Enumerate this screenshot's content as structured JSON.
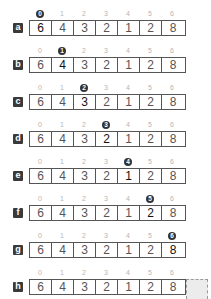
{
  "rows": [
    {
      "label": "a",
      "active": 0,
      "indices": [
        "0",
        "1",
        "2",
        "3",
        "4",
        "5",
        "6"
      ],
      "values": [
        "6",
        "4",
        "3",
        "2",
        "1",
        "2",
        "8"
      ]
    },
    {
      "label": "b",
      "active": 1,
      "indices": [
        "0",
        "1",
        "2",
        "3",
        "4",
        "5",
        "6"
      ],
      "values": [
        "6",
        "4",
        "3",
        "2",
        "1",
        "2",
        "8"
      ]
    },
    {
      "label": "c",
      "active": 2,
      "indices": [
        "0",
        "1",
        "2",
        "3",
        "4",
        "5",
        "6"
      ],
      "values": [
        "6",
        "4",
        "3",
        "2",
        "1",
        "2",
        "8"
      ]
    },
    {
      "label": "d",
      "active": 3,
      "indices": [
        "0",
        "1",
        "2",
        "3",
        "4",
        "5",
        "6"
      ],
      "values": [
        "6",
        "4",
        "3",
        "2",
        "1",
        "2",
        "8"
      ]
    },
    {
      "label": "e",
      "active": 4,
      "indices": [
        "0",
        "1",
        "2",
        "3",
        "4",
        "5",
        "6"
      ],
      "values": [
        "6",
        "4",
        "3",
        "2",
        "1",
        "2",
        "8"
      ]
    },
    {
      "label": "f",
      "active": 5,
      "indices": [
        "0",
        "1",
        "2",
        "3",
        "4",
        "5",
        "6"
      ],
      "values": [
        "6",
        "4",
        "3",
        "2",
        "1",
        "2",
        "8"
      ]
    },
    {
      "label": "g",
      "active": 6,
      "indices": [
        "0",
        "1",
        "2",
        "3",
        "4",
        "5",
        "6"
      ],
      "values": [
        "6",
        "4",
        "3",
        "2",
        "1",
        "2",
        "8"
      ]
    },
    {
      "label": "h",
      "active": -1,
      "indices": [
        "0",
        "1",
        "2",
        "3",
        "4",
        "5",
        "6"
      ],
      "values": [
        "6",
        "4",
        "3",
        "2",
        "1",
        "2",
        "8"
      ]
    }
  ],
  "colors": {
    "badge": "#3a3a3a",
    "active_index": "#333333",
    "cell_border": "#555555",
    "extension_fill": "#ececec"
  }
}
